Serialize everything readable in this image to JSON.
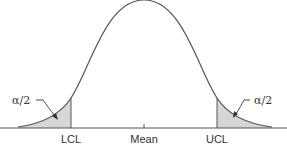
{
  "diagram": {
    "type": "normal-distribution-control-limits",
    "labels": {
      "lcl": "LCL",
      "mean": "Mean",
      "ucl": "UCL",
      "left_tail": "α/2",
      "right_tail": "α/2"
    },
    "colors": {
      "curve": "#555555",
      "axis": "#555555",
      "tail_fill": "#d6d6d6",
      "text": "#333333"
    }
  }
}
